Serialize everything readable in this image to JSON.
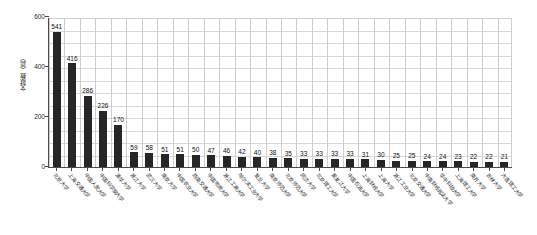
{
  "chart_data": {
    "type": "bar",
    "title": "",
    "subtitle": "",
    "xlabel": "",
    "ylabel": "文献数（篇）",
    "ylim": [
      0,
      600
    ],
    "yticks": [
      0,
      200,
      400,
      600
    ],
    "grid": "both",
    "legend": "none",
    "orientation": "vertical",
    "bar_color": "#262626",
    "categories": [
      "北京大学",
      "上海交通大学",
      "中国人民大学",
      "中国科学院大学",
      "清华大学",
      "浙江大学",
      "武汉大学",
      "南京大学",
      "中国农业大学",
      "西南交通大学",
      "中国地质大学",
      "浙江工商大学",
      "哈尔滨工业大学",
      "复旦大学",
      "南京师范大学",
      "北京师范大学",
      "同济大学",
      "北京理工大学",
      "黑龙江大学",
      "中国石油大学",
      "上海财经大学",
      "上海大学",
      "浙江工业大学",
      "北京交通大学",
      "中南财经政法大学",
      "华中科技大学",
      "上海理工大学",
      "南开大学",
      "吉林大学",
      "大连理工大学"
    ],
    "values": [
      541,
      416,
      286,
      226,
      170,
      59,
      58,
      51,
      51,
      50,
      47,
      46,
      42,
      40,
      38,
      35,
      33,
      33,
      33,
      33,
      31,
      30,
      25,
      25,
      24,
      24,
      23,
      22,
      22,
      21
    ]
  }
}
